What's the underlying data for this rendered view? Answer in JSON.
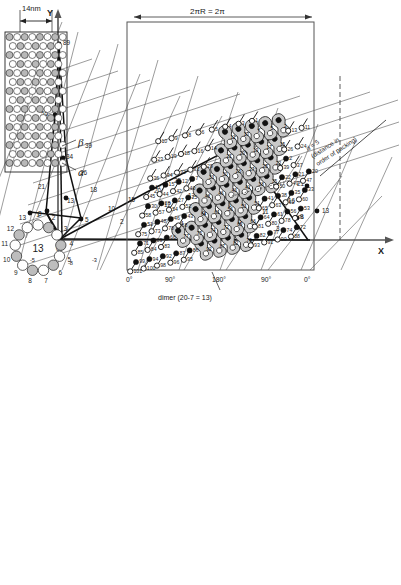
{
  "figure": {
    "type": "scientific-diagram",
    "panels": [
      "phyllotaxis-graph",
      "microtubule-cylinder",
      "cross-section-ring",
      "unrolled-lattice"
    ]
  },
  "graph": {
    "axis_x_label": "X",
    "axis_y_label": "Y",
    "y_axis_points": [
      "89",
      "55",
      "34",
      "21",
      "13",
      "8",
      "5",
      "0"
    ],
    "origin_label": "0",
    "negative_labels": [
      "-5",
      "-13",
      "-8",
      "-3"
    ],
    "lattice_labels": [
      "39",
      "26",
      "18",
      "10",
      "15",
      "2",
      "20",
      "25",
      "12",
      "17",
      "7",
      "4",
      "9",
      "14",
      "6",
      "1",
      "19",
      "11",
      "3",
      "40",
      "16",
      "21",
      "13",
      "8"
    ],
    "apex_label": "40",
    "right_points": [
      "21",
      "16",
      "13",
      "8",
      "3"
    ],
    "colors": {
      "line": "#1a1a1a",
      "axis": "#555555",
      "grid": "#4a4a4a"
    }
  },
  "cylinder": {
    "width_label": "14nm",
    "subunit_beta": "β",
    "subunit_alpha": "α"
  },
  "ring": {
    "center_label": "13",
    "protofilaments": [
      "1",
      "2",
      "3",
      "4",
      "5",
      "6",
      "7",
      "8",
      "9",
      "10",
      "11",
      "12",
      "13"
    ]
  },
  "lattice": {
    "circumference_label": "2πR = 2π",
    "angle_ticks": [
      "0°",
      "90°",
      "180°",
      "90°",
      "0°"
    ],
    "dimer_caption": "dimer (20-7 = 13)",
    "distance_note_line1": "d = 5",
    "distance_note_line2": "(distance in",
    "distance_note_line3": "order of packing)",
    "open_circle_numbers": [
      "101",
      "100",
      "98",
      "96",
      "95",
      "93",
      "91",
      "90",
      "88",
      "85",
      "84",
      "83",
      "81",
      "80",
      "78",
      "76",
      "75",
      "73",
      "70",
      "68",
      "65",
      "63",
      "62",
      "60",
      "58",
      "57",
      "54",
      "52",
      "50",
      "49",
      "47",
      "45",
      "44",
      "42",
      "40",
      "39",
      "37",
      "36",
      "34",
      "32",
      "31",
      "29",
      "26",
      "24",
      "23",
      "19",
      "18",
      "16",
      "14",
      "13",
      "11",
      "10",
      "9",
      "8",
      "6",
      "5",
      "4",
      "3",
      "1"
    ],
    "filled_circle_numbers": [
      "99",
      "94",
      "92",
      "87",
      "86",
      "82",
      "77",
      "74",
      "72",
      "71",
      "69",
      "66",
      "64",
      "61",
      "56",
      "53",
      "51",
      "48",
      "46",
      "43",
      "41",
      "38",
      "35",
      "33",
      "30",
      "28",
      "27",
      "25",
      "22",
      "21",
      "20",
      "17",
      "15",
      "12",
      "7",
      "2"
    ],
    "dimer_inner_numbers": [
      "92",
      "87",
      "82",
      "79",
      "77",
      "75",
      "74",
      "72",
      "69",
      "66",
      "64",
      "61",
      "56",
      "53",
      "51",
      "48",
      "46",
      "43",
      "41",
      "38",
      "35",
      "33",
      "30",
      "28",
      "27",
      "25",
      "22",
      "21",
      "20",
      "19",
      "17",
      "15",
      "12",
      "10",
      "7",
      "5",
      "2"
    ],
    "colors": {
      "dimer_fill": "#cfcfcf",
      "border": "#2b2b2b",
      "open": "#ffffff",
      "filled": "#111111"
    }
  }
}
